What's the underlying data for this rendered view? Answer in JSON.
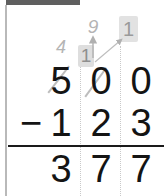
{
  "document": {
    "kind": "vertical-subtraction-worksheet",
    "title": "500 minus 123 column subtraction with regrouping"
  },
  "problem": {
    "operator": "−",
    "minuend": {
      "value": "500",
      "digits": [
        "5",
        "0",
        "0"
      ]
    },
    "subtrahend": {
      "value": "123",
      "digits": [
        "1",
        "2",
        "3"
      ]
    },
    "answer": {
      "value": "377",
      "digits": [
        "3",
        "7",
        "7"
      ]
    }
  },
  "annotations": {
    "hundreds_regroup": {
      "label": "4",
      "meaning": "hundreds digit reduced from 5 to 4"
    },
    "tens_regroup": {
      "label": "9",
      "meaning": "tens digit becomes 9 after regrouping"
    },
    "ones_regroup": {
      "label": "1",
      "meaning": "one ten carried to the ones column"
    },
    "struck_one": {
      "label": "1",
      "meaning": "previously written 1 crossed out in the tens column"
    },
    "crossed_digits": [
      "5",
      "0"
    ]
  },
  "colors": {
    "ink": "#141414",
    "pencil": "#b4b4b4",
    "highlight": "#e2e2e2",
    "rule": "#1a1a1a",
    "guide": "#c9c9c9",
    "left_rule": "#b9b9b9",
    "top_bar": "#5f5f5f",
    "background": "#ffffff"
  }
}
